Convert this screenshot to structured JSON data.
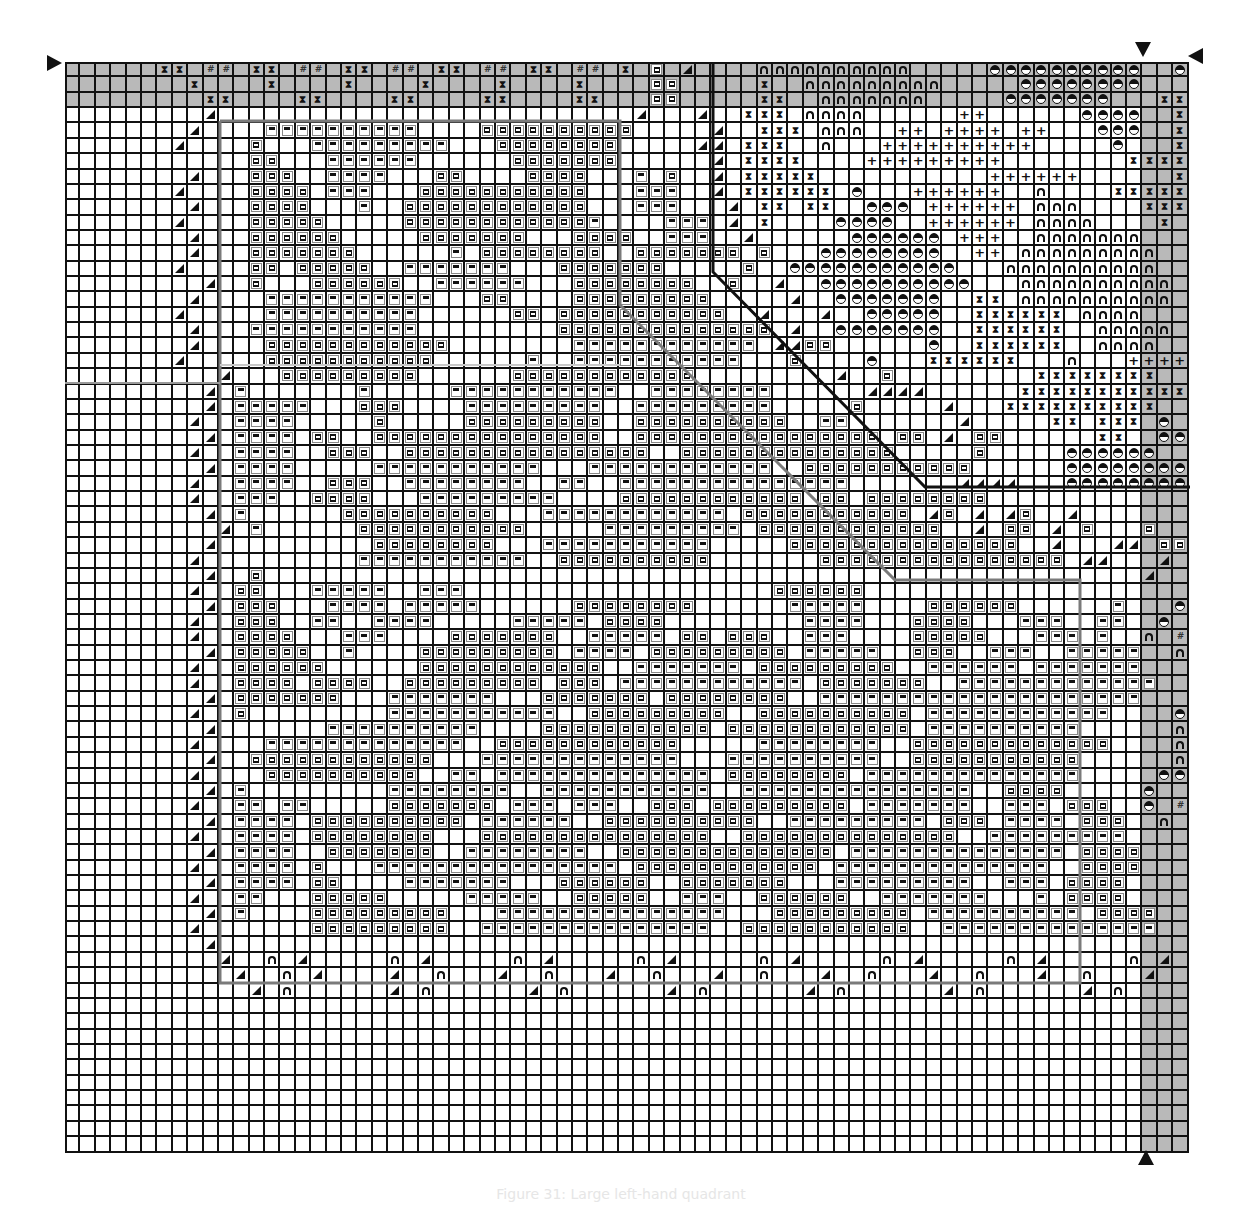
{
  "chart_data": {
    "type": "table",
    "grid": {
      "columns": 73,
      "rows": 71,
      "cell_px": 15.4,
      "origin": [
        65,
        62
      ]
    },
    "shaded": {
      "top_rows": 3,
      "right_col_start": 70,
      "color": "#b9b9b9"
    },
    "legend": {
      ".": "empty",
      "a": "left-arrow-box",
      "b": "bar-box",
      "t": "triangle",
      "h": "hourglass",
      "#": "hash",
      "n": "arch",
      "o": "half-circle",
      "+": "plus"
    },
    "rows": [
      "......hh.##.hh.##.hh.##.hh.##.hh.##.h.a.t....nnnnnnnnnn.....oooooooooo..o...",
      "........h....h....h....h....h....h....aa.....h..nnnnnnnnn.....oooooooo...hh...",
      ".........hh....hh....hh....hh....hh...aa.....hh..nnnnnnn.....ooooooo...hhhh..",
      ".........t...........................t...t..hhh.nnnn......++......oooo..hhhhhh",
      "........t....bbbbbbbbbb....aaaaaaaaaa.....t..hhh.nnn..++.++++.++...ooo..hhhhhh",
      ".......t....a...bbbbbbbbb...aaaaaaaa.....tt.hhh..n...++++++++++.....o...hhhhhh",
      "............aa...bbbbbb......aaaaaaa......t.hhhh....+++++++++........hhhhhhhh",
      "........t...aaa..bbbb...aa....aaaa...b.a..t.hhhhh...........++++++......hhhhhh",
      ".......t....aaaa.bbb...aaaaaaaaaaa...bbb..t.hhhhhh.o...++++++..n....hhhhhhh",
      "........t...aaaa...b..aaaaaaaaaaaa...bbb...t.hh.hh..ooo.++++++.nnn....hhhhhh",
      ".......t....aaaaa.....aaaaaaaaaaaab....bbb.t.h....oooo..++++++.nnnn....h....",
      "........t...aaaaaa.....aaaaaaa...aaaa..bbb..t......oooooo.+++..nnnnnnn.....",
      "........t...aaaaaaa......b.aaaaaaaa..aaaaaaa.a...oooooooo..++.nnnnnnnnn....o",
      ".......t....aa.aaaaa..bbbbbbb...aaaaaaa.....a..ooooooooooo...nnnnnnnnnn...oo",
      ".........t..a...aaaaaa..bbbbbb...aaaaaaaa..a..t..oooooooooo...nnnnnnnnnn...o",
      "........t....bbbbbbbbbbb...aa....aaaaaaaaa.....t..ooooooo..hh.nnnnnnnnnn....",
      ".......t.....bbbbbbbbbb......aa.aaaaaaaaaaa..t...t..ooooo..hhhhhh.nnnn...++.",
      "........t...bbbbbbbbbbb.........aaaaaaaaaaaaaa.t..ooooooo..hhhhhh..nnnnn..++...",
      "........t....aaaaaaaaaaaa........bbbbbbbbbbbb.ttaa......o..hhhhhh..nnnn..+++++.",
      ".......t.....aaaaaaaaaaa......b..bbbbbbbbbbb...a....o...hhhhhh...n...++++++++..",
      "..........t...aaaaaaaaa......aaaaaaaaaaaa.........t..a.........hhhhhhhh...+++++++",
      ".........t.b.......b.....bbbbbbbbbbb..bbbbbbbb......tttt......hhhhhhhhhhh..+++++",
      ".........t.bbbbb...aaa....bbbbbbbbb..bbbbbbbbb.....a.....t...hhhhhhhhhh....+++++",
      "........t..bbbb.....a.....aaaaaaaaa..aaaaaaaaaa..bb.......t.....hh.hhh.o...+++++",
      ".........t.bbbb.aa..aaaaaaaaaaaaaaa..aaaaaaaaaaaaaaaa.aa.t.aa......hh..ooo..++++",
      "........t..bbbb..aaa..aaaaaaaaaaaaaaaa..aaaaaaaaaaaaaa.....a.....oooooo.......",
      ".........t.bbbb.....bbbbbbbbbbb...bbbbbbbbbbbb..aaaaaaaaaaa......ooooooooooo.++",
      "........t..bbbb..aaa..bbbbbbbb..bb..bbbbbbbbbbbbbbb.......tttt...ooooooooooo.++",
      "........t..bbb..aaaa...bbbbbbbbb....aaaaaaaaaaaa.aa.aaaaaaaa.....................",
      ".........t.b......aaaaaaaaaa...bbbbbbbbbbbb.aaaaaaaaaaa.ta.t.ta..t.......aaaa....",
      "..........t.b......aaaaaaaaaaa.....bbbbbbbbb.aaaaaaaaaaaa..t.aa.t.a...a...t.tt.a",
      ".........t..........aaaaaaaa...bbbbbbbbbbb.....aaaaaaaaaaaaaaa..t...tt.aa..t..ta",
      "........t..........bbbbbbbbbbb..aaaaaaaaaa.......aaaaaaaaaaaaaaaa.tt...t...aa..t.",
      ".........t..a.........................................................t..aa...",
      "........t..aa...bbbbb..bbb....................aaaaaa.....................oo...o.",
      ".........t.aaa...bbbb.bbbbb......aaaaaaaa......bbbbb....aaaaaa......b...o.....o",
      "........t..aaa..bb..bbbb.....bbbbb.aaaa.........bbbb...aaaa...bbb..bb..o.##..o",
      "........t..aaaa...bbb....aaaaaaa..bbbbb.aa.aaa..bbb....aaaaa...bbb.b..n.##..n",
      ".........t.aaaaa..b....aaaaaaaaa.bbbb.aaaaaaaaa.bbbbb..aaa..bbb..bbbbb..n...n",
      "........t..aaaaaa......aaaaaaaaaaaa..bbbbbbb.aaaaaaaaa..bbbbbb.bbbbbbb....nn..",
      "........t..aaaa.aaaa..aaaaaaaaa.aaa.bbbbbbbbbbbb.aaaaaaa..bbbbbbbbbbbbb....oo..",
      ".........t.aaaaaaa...bbbbbbb...aaaaaaa.aaaaaaaa..bbbbbbbbbbbbbbbbbbbbb....o...o",
      "........t..a.........bbbbbbbbbbb..aaaaaaaaa..aaaaaaaaaa.bbbbbbbbbbbb....o.##..o",
      ".........t.......bbbbbbbbbb....aaaaaaaaaaa.aaaaaaaaaaaa.bbbbbbbbbb......n.##..n",
      "........t....bbbbbbbbbbbbb..aaaaaaaaaaaa.....bbbbbbbb..aaaaaaaaaaaaa....n...n",
      ".........t..aaaaaaaaaaaa...bbbbbbbbbbbbb...bbbbbbbbbb..aaaaaaaaaaa......nn..",
      "........t....aaaaaaaaaa..bb.bbbbbbbbbbbbbb.aaaaaaaa.bbbbbbbbbbbbbb.....oo..",
      ".........t.b.........bbbbbbbb..bbbbbbbbbbb..bbbbbbbbbbbbbbb..aaaa.....o...o",
      "........t..bb.bb.....aaaaaaa.bbb.bbb..aaa.aaaaaaaaa.bbbbbbb..bbb.aaa..o.##..o",
      ".........t.bbbb.aaaaaaaaaa.bbbbbb..aaaaaaaaaa..bbbbbbbbb.aaa.bbbb.aaa..n.##..n",
      "........t..bbbb.aaaaaaaa...aaaaaaaaaaaaaaa..aaaaaaaaaaaaaa..bbbbbbbbb....n...n",
      ".........t.bbbb..aaaaaaa..bbbbbbbb..aaaaaaaaaaaaaa.bbbbbbbbbbbbbb.aaaa....nn..",
      "........t..bbbb.a...bbbbbbbbbbbbbbbb.aaaaaaaaaaaa.bbbbbbbbbbbbbb..aaaa....oo..",
      ".........t.bbbb.aa....bbbbbbb...aaaaaa..aaaaaaa...bbbbbbbbb..bbb.aaaa.....o...o",
      "........t..bb...aaaaa.....bbbbb..aaaaa..bbb..aaaaaa..bbbbbbb...b.aaaa....o.##..o",
      ".........t.b....aaaaaaaaa...bbbbbbbbbbbbbbb...aaaaaaaaa.bbbbbbbbbb.aaaa..n.##..n",
      "........t.......aaaaaaaaa..bbbbbbbbbbbbbbb..aaaaaaaaaaa..bbbbbbbbbbbbbb..n...n",
      ".........t....................................................................nn..",
      "..........t..n.t.....n.t.....n.t.....n.t.....n.t.....n.t.....n.t.....n.t.....oo..",
      "...........t..n.t....t..n...t..n...t..n...t..n...t..n...t..n...t..n...t..n...oo..",
      "............t.n......t.n......t.n......t.n......t.n......t.n......t.n.........",
      "...............................................................................",
      "...............................................................................",
      "...............................................................................",
      "...............................................................................",
      "...............................................................................",
      "...............................................................................",
      "...............................................................................",
      "...............................................................................",
      "..............................................................................."
    ],
    "outlines": [
      {
        "name": "inner-upper-left-region",
        "color": "#7a7a7a",
        "width": 3,
        "points": [
          [
            220,
            121
          ],
          [
            620,
            121
          ],
          [
            620,
            305
          ],
          [
            895,
            580
          ],
          [
            1080,
            580
          ],
          [
            1080,
            983
          ],
          [
            220,
            983
          ],
          [
            220,
            121
          ]
        ]
      },
      {
        "name": "upper-right-region",
        "color": "#111111",
        "width": 3,
        "points": [
          [
            713,
            62
          ],
          [
            713,
            272
          ],
          [
            925,
            487
          ],
          [
            1190,
            487
          ]
        ]
      },
      {
        "name": "left-midline",
        "color": "#9a9a9a",
        "width": 2,
        "points": [
          [
            65,
            383
          ],
          [
            220,
            383
          ]
        ]
      },
      {
        "name": "upper-midline",
        "color": "#c8c8c8",
        "width": 2,
        "points": [
          [
            220,
            365
          ],
          [
            620,
            365
          ]
        ]
      }
    ],
    "center_markers": {
      "left": [
        55,
        62
      ],
      "top": [
        1143,
        48
      ],
      "right": [
        1195,
        55
      ],
      "bottom": [
        1146,
        1157
      ]
    }
  },
  "caption": "Figure 31: Large left-hand quadrant"
}
